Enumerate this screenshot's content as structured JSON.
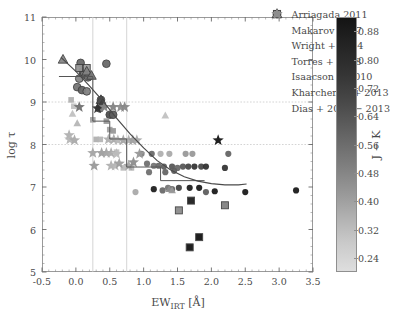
{
  "figure": {
    "xlabel_main": "EW",
    "xlabel_sub": "IRT",
    "xlabel_unit": " [Å]",
    "ylabel": "log τ",
    "colorbar_label": "J − K"
  },
  "axes": {
    "xticks": [
      "-0.5",
      "0.0",
      "0.5",
      "1.0",
      "1.5",
      "2.0",
      "2.5",
      "3.0",
      "3.5"
    ],
    "yticks": [
      "5",
      "6",
      "7",
      "8",
      "9",
      "10",
      "11"
    ]
  },
  "colorbar": {
    "ticks": [
      "0.24",
      "0.32",
      "0.40",
      "0.48",
      "0.56",
      "0.64",
      "0.72",
      "0.80",
      "0.88"
    ],
    "cmin": 0.2,
    "cmax": 0.92,
    "low_color": "#dedede",
    "high_color": "#141414"
  },
  "legend": [
    {
      "label": "Arriagada 2011",
      "marker": "circle-edged"
    },
    {
      "label": "Makarov 2007",
      "marker": "square-edged"
    },
    {
      "label": "Wright + 2004",
      "marker": "triangle-edged"
    },
    {
      "label": "Torres + 2008",
      "marker": "circle"
    },
    {
      "label": "Isaacson + 2010",
      "marker": "square"
    },
    {
      "label": "Kharchenko + 2013",
      "marker": "triangle"
    },
    {
      "label": "Dias + 2002 − 2013",
      "marker": "star"
    }
  ],
  "chart_data": {
    "type": "scatter",
    "title": "",
    "xlabel": "EW_IRT [Å]",
    "ylabel": "log τ",
    "xlim": [
      -0.5,
      3.5
    ],
    "ylim": [
      5,
      11
    ],
    "grid": true,
    "gridlines_x": [
      0.25,
      0.75
    ],
    "gridlines_y": [
      8,
      9
    ],
    "legend_position": "upper-right",
    "colorbar": {
      "label": "J − K",
      "range": [
        0.2,
        0.92
      ],
      "cmap": "gray-reversed"
    },
    "series": [
      {
        "name": "Arriagada 2011",
        "marker": "circle-edged",
        "points": [
          {
            "x": 0.07,
            "y": 9.92,
            "c": 0.6
          },
          {
            "x": 0.1,
            "y": 9.72,
            "c": 0.62
          },
          {
            "x": 0.12,
            "y": 9.65,
            "c": 0.55
          },
          {
            "x": 0.05,
            "y": 9.55,
            "c": 0.5
          },
          {
            "x": 0.18,
            "y": 9.58,
            "c": 0.58
          },
          {
            "x": 0.02,
            "y": 9.35,
            "c": 0.56
          },
          {
            "x": 0.09,
            "y": 9.28,
            "c": 0.62
          },
          {
            "x": 0.16,
            "y": 9.25,
            "c": 0.52
          },
          {
            "x": 0.45,
            "y": 9.9,
            "c": 0.6
          },
          {
            "x": 0.37,
            "y": 9.05,
            "c": 0.66
          },
          {
            "x": 0.5,
            "y": 8.7,
            "c": 0.7
          },
          {
            "x": 0.55,
            "y": 8.7,
            "c": 0.64
          },
          {
            "x": 0.35,
            "y": 8.85,
            "c": 0.58
          }
        ]
      },
      {
        "name": "Makarov 2007",
        "marker": "square-edged",
        "points": [
          {
            "x": 0.05,
            "y": 9.8,
            "c": 0.45
          },
          {
            "x": 0.16,
            "y": 9.8,
            "c": 0.42
          },
          {
            "x": 1.7,
            "y": 6.68,
            "c": 0.86
          },
          {
            "x": 1.52,
            "y": 6.45,
            "c": 0.48
          },
          {
            "x": 2.2,
            "y": 6.57,
            "c": 0.52
          },
          {
            "x": 1.82,
            "y": 5.82,
            "c": 0.9
          },
          {
            "x": 1.68,
            "y": 5.58,
            "c": 0.9
          }
        ]
      },
      {
        "name": "Wright + 2004",
        "marker": "triangle-edged",
        "points": [
          {
            "x": -0.19,
            "y": 10.0,
            "c": 0.5
          },
          {
            "x": 0.16,
            "y": 9.72,
            "c": 0.52
          },
          {
            "x": 0.23,
            "y": 9.62,
            "c": 0.56
          },
          {
            "x": 0.37,
            "y": 9.05,
            "c": 0.7
          },
          {
            "x": 0.39,
            "y": 8.95,
            "c": 0.74
          }
        ]
      },
      {
        "name": "Torres + 2008",
        "marker": "circle",
        "points": [
          {
            "x": 0.97,
            "y": 7.78,
            "c": 0.52
          },
          {
            "x": 1.12,
            "y": 7.78,
            "c": 0.6
          },
          {
            "x": 1.25,
            "y": 7.78,
            "c": 0.36
          },
          {
            "x": 1.38,
            "y": 7.78,
            "c": 0.38
          },
          {
            "x": 1.62,
            "y": 7.78,
            "c": 0.44
          },
          {
            "x": 1.72,
            "y": 7.78,
            "c": 0.44
          },
          {
            "x": 2.25,
            "y": 7.78,
            "c": 0.62
          },
          {
            "x": 1.05,
            "y": 7.55,
            "c": 0.58
          },
          {
            "x": 1.15,
            "y": 7.5,
            "c": 0.56
          },
          {
            "x": 1.22,
            "y": 7.5,
            "c": 0.6
          },
          {
            "x": 1.3,
            "y": 7.48,
            "c": 0.64
          },
          {
            "x": 1.42,
            "y": 7.48,
            "c": 0.66
          },
          {
            "x": 1.5,
            "y": 7.45,
            "c": 0.6
          },
          {
            "x": 1.58,
            "y": 7.48,
            "c": 0.66
          },
          {
            "x": 1.66,
            "y": 7.48,
            "c": 0.72
          },
          {
            "x": 1.75,
            "y": 7.48,
            "c": 0.78
          },
          {
            "x": 1.85,
            "y": 7.48,
            "c": 0.72
          },
          {
            "x": 1.92,
            "y": 7.48,
            "c": 0.8
          },
          {
            "x": 2.2,
            "y": 7.45,
            "c": 0.78
          },
          {
            "x": 1.08,
            "y": 7.35,
            "c": 0.58
          },
          {
            "x": 1.32,
            "y": 7.35,
            "c": 0.62
          },
          {
            "x": 1.45,
            "y": 7.38,
            "c": 0.64
          },
          {
            "x": 1.15,
            "y": 6.95,
            "c": 0.86
          },
          {
            "x": 1.28,
            "y": 6.92,
            "c": 0.6
          },
          {
            "x": 1.36,
            "y": 6.98,
            "c": 0.56
          },
          {
            "x": 1.42,
            "y": 6.95,
            "c": 0.62
          },
          {
            "x": 1.52,
            "y": 6.98,
            "c": 0.74
          },
          {
            "x": 1.68,
            "y": 6.98,
            "c": 0.86
          },
          {
            "x": 1.82,
            "y": 6.98,
            "c": 0.88
          },
          {
            "x": 1.92,
            "y": 6.88,
            "c": 0.64
          },
          {
            "x": 2.05,
            "y": 6.9,
            "c": 0.88
          },
          {
            "x": 2.5,
            "y": 6.88,
            "c": 0.88
          },
          {
            "x": 3.25,
            "y": 6.92,
            "c": 0.88
          },
          {
            "x": 0.88,
            "y": 6.88,
            "c": 0.38
          }
        ]
      },
      {
        "name": "Isaacson + 2010",
        "marker": "square",
        "points": [
          {
            "x": -0.07,
            "y": 9.05,
            "c": 0.36
          },
          {
            "x": -0.03,
            "y": 8.9,
            "c": 0.3
          },
          {
            "x": 0.25,
            "y": 8.58,
            "c": 0.4
          },
          {
            "x": 0.45,
            "y": 8.55,
            "c": 0.44
          },
          {
            "x": 0.5,
            "y": 8.35,
            "c": 0.4
          },
          {
            "x": 0.55,
            "y": 8.32,
            "c": 0.44
          },
          {
            "x": 0.3,
            "y": 8.12,
            "c": 0.36
          },
          {
            "x": 0.36,
            "y": 8.12,
            "c": 0.34
          },
          {
            "x": 0.6,
            "y": 7.82,
            "c": 0.3
          },
          {
            "x": 0.7,
            "y": 7.45,
            "c": 0.32
          },
          {
            "x": 0.82,
            "y": 7.45,
            "c": 0.34
          }
        ]
      },
      {
        "name": "Kharchenko + 2013",
        "marker": "triangle",
        "points": [
          {
            "x": -0.05,
            "y": 8.72,
            "c": 0.3
          },
          {
            "x": 0.02,
            "y": 8.5,
            "c": 0.34
          },
          {
            "x": 1.32,
            "y": 8.68,
            "c": 0.3
          },
          {
            "x": 1.38,
            "y": 6.95,
            "c": 0.48
          },
          {
            "x": 1.42,
            "y": 6.92,
            "c": 0.44
          }
        ]
      },
      {
        "name": "Dias + 2002 - 2013",
        "marker": "star",
        "points": [
          {
            "x": -0.1,
            "y": 8.22,
            "c": 0.36
          },
          {
            "x": -0.09,
            "y": 8.12,
            "c": 0.34
          },
          {
            "x": 0.05,
            "y": 8.88,
            "c": 0.58
          },
          {
            "x": 0.32,
            "y": 8.85,
            "c": 0.8
          },
          {
            "x": 0.42,
            "y": 8.88,
            "c": 0.5
          },
          {
            "x": 0.55,
            "y": 8.88,
            "c": 0.52
          },
          {
            "x": 0.66,
            "y": 8.88,
            "c": 0.48
          },
          {
            "x": 0.72,
            "y": 8.88,
            "c": 0.5
          },
          {
            "x": 2.1,
            "y": 8.1,
            "c": 0.9
          },
          {
            "x": 0.48,
            "y": 8.12,
            "c": 0.36
          },
          {
            "x": 0.56,
            "y": 8.12,
            "c": 0.38
          },
          {
            "x": 0.62,
            "y": 8.1,
            "c": 0.34
          },
          {
            "x": 0.7,
            "y": 8.1,
            "c": 0.4
          },
          {
            "x": 0.78,
            "y": 8.1,
            "c": 0.36
          },
          {
            "x": 0.84,
            "y": 8.1,
            "c": 0.42
          },
          {
            "x": 0.9,
            "y": 8.1,
            "c": 0.38
          },
          {
            "x": 0.25,
            "y": 7.8,
            "c": 0.4
          },
          {
            "x": 0.38,
            "y": 7.8,
            "c": 0.42
          },
          {
            "x": 0.45,
            "y": 7.8,
            "c": 0.4
          },
          {
            "x": 0.52,
            "y": 7.8,
            "c": 0.38
          },
          {
            "x": 0.6,
            "y": 7.78,
            "c": 0.32
          },
          {
            "x": 0.27,
            "y": 7.5,
            "c": 0.44
          },
          {
            "x": 0.52,
            "y": 7.5,
            "c": 0.36
          },
          {
            "x": 0.58,
            "y": 7.5,
            "c": 0.34
          },
          {
            "x": 0.64,
            "y": 7.55,
            "c": 0.42
          },
          {
            "x": 0.78,
            "y": 7.5,
            "c": 0.4
          },
          {
            "x": 0.85,
            "y": 7.58,
            "c": 0.48
          },
          {
            "x": 0.94,
            "y": 7.78,
            "c": 0.44
          },
          {
            "x": -0.02,
            "y": 8.1,
            "c": 0.38
          }
        ]
      }
    ],
    "step_curve": {
      "name": "binned-median-step",
      "points": [
        {
          "x": -0.25,
          "y": 9.6
        },
        {
          "x": 0.25,
          "y": 9.6
        },
        {
          "x": 0.25,
          "y": 8.55
        },
        {
          "x": 0.5,
          "y": 8.55
        },
        {
          "x": 0.5,
          "y": 8.13
        },
        {
          "x": 0.75,
          "y": 8.13
        },
        {
          "x": 0.75,
          "y": 7.47
        },
        {
          "x": 1.25,
          "y": 7.47
        },
        {
          "x": 1.25,
          "y": 7.15
        },
        {
          "x": 1.9,
          "y": 7.15
        }
      ]
    },
    "fit_curve": {
      "name": "smooth-fit",
      "points": [
        {
          "x": -0.22,
          "y": 10.05
        },
        {
          "x": 0.0,
          "y": 9.72
        },
        {
          "x": 0.2,
          "y": 9.38
        },
        {
          "x": 0.4,
          "y": 9.02
        },
        {
          "x": 0.6,
          "y": 8.62
        },
        {
          "x": 0.8,
          "y": 8.25
        },
        {
          "x": 1.0,
          "y": 7.92
        },
        {
          "x": 1.2,
          "y": 7.62
        },
        {
          "x": 1.4,
          "y": 7.4
        },
        {
          "x": 1.6,
          "y": 7.24
        },
        {
          "x": 1.8,
          "y": 7.14
        },
        {
          "x": 2.0,
          "y": 7.08
        },
        {
          "x": 2.2,
          "y": 7.05
        },
        {
          "x": 2.4,
          "y": 7.05
        },
        {
          "x": 2.52,
          "y": 7.07
        }
      ]
    }
  }
}
